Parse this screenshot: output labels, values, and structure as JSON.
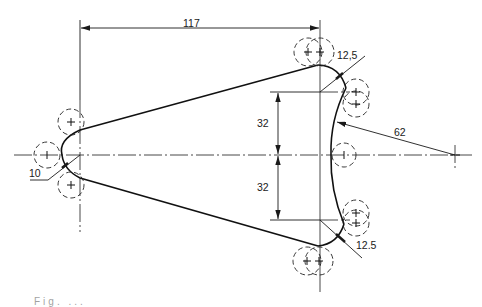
{
  "drawing": {
    "type": "engineering-drawing",
    "subject": "tangent arcs construction (link/lever profile)",
    "line_color": "#1a1a1a",
    "construction_color": "#333333",
    "background": "#ffffff"
  },
  "dimensions": {
    "horizontal_length": "117",
    "upper_vertical": "32",
    "lower_vertical": "32",
    "top_right_radius": "12,5",
    "bottom_right_radius": "12.5",
    "concave_radius": "62",
    "left_radius": "10"
  },
  "caption": {
    "text": "Fig. ..."
  }
}
